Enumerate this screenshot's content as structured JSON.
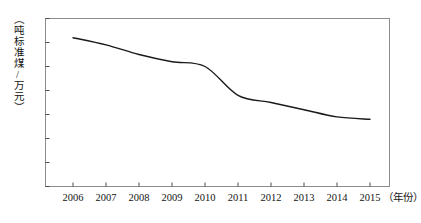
{
  "chart_data": {
    "type": "line",
    "title": "",
    "xlabel": "（年份）",
    "ylabel": "（吨标准煤/万元）",
    "categories": [
      "2006",
      "2007",
      "2008",
      "2009",
      "2010",
      "2011",
      "2012",
      "2013",
      "2014",
      "2015"
    ],
    "x": [
      2006,
      2007,
      2008,
      2009,
      2010,
      2011,
      2012,
      2013,
      2014,
      2015
    ],
    "values": [
      0.82,
      0.79,
      0.75,
      0.72,
      0.7,
      0.58,
      0.55,
      0.52,
      0.49,
      0.48
    ],
    "series": [
      {
        "name": "单位GDP能耗",
        "values": [
          0.82,
          0.79,
          0.75,
          0.72,
          0.7,
          0.58,
          0.55,
          0.52,
          0.49,
          0.48
        ]
      }
    ],
    "ylim": [
      0.2,
      0.9
    ],
    "yticks": [
      0.2,
      0.3,
      0.4,
      0.5,
      0.6,
      0.7,
      0.8,
      0.9
    ],
    "ytick_labels": [
      "0.2",
      "0.3",
      "0.4",
      "0.5",
      "0.6",
      "0.7",
      "0.8",
      "0.9"
    ],
    "xtick_labels": [
      "2006",
      "2007",
      "2008",
      "2009",
      "2010",
      "2011",
      "2012",
      "2013",
      "2014",
      "2015"
    ],
    "grid": false,
    "legend": "none",
    "line_color": "#1a1a1a",
    "axis_color": "#4d4d4d",
    "background_color": "#ffffff",
    "border_color": "#8c8c8c"
  }
}
